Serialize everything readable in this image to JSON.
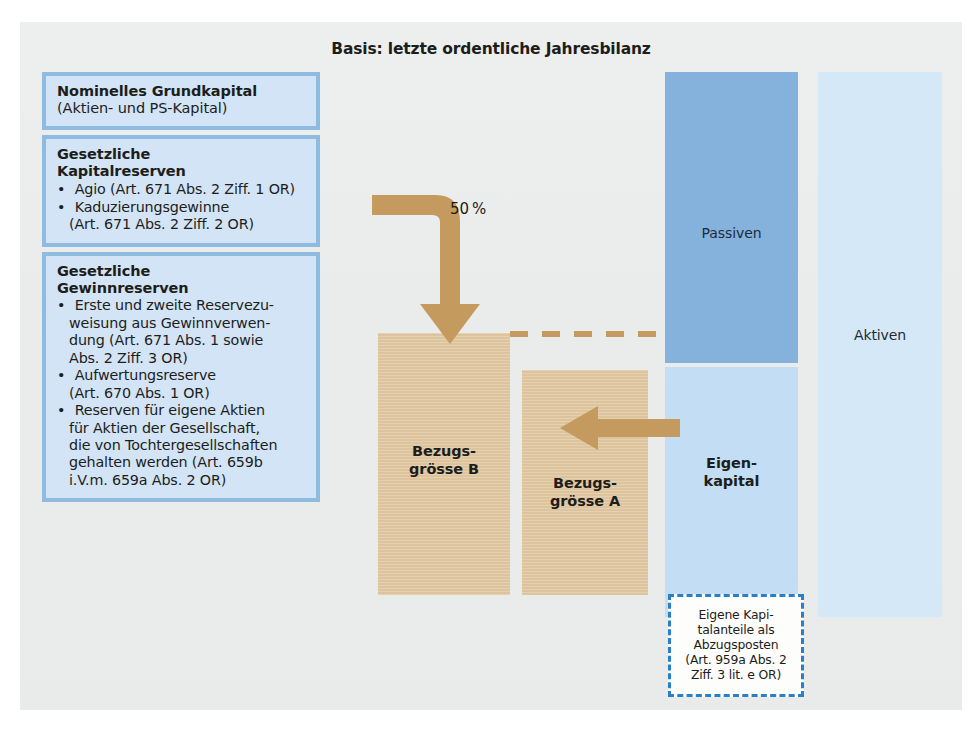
{
  "title": "Basis: letzte ordentliche Jahresbilanz",
  "colors": {
    "board_bg": "#eceeed",
    "box_frame": "#8fbbe0",
    "box_fill": "#d2e4f5",
    "passiven": "#85b2dd",
    "eigenkapital": "#c3ddf4",
    "aktiven": "#d5e8f8",
    "bar_tan": "#ddc49d",
    "arrow_tan": "#c49a5e",
    "dashed_blue": "#2a7fc9"
  },
  "left_boxes": [
    {
      "heading": "Nominelles Grundkapital",
      "subtitle": "(Aktien- und PS-Kapital)",
      "items": []
    },
    {
      "heading": "Gesetzliche\nKapitalreserven",
      "subtitle": "",
      "items": [
        {
          "main": "Agio (Art. 671 Abs. 2 Ziff. 1 OR)",
          "cont": ""
        },
        {
          "main": "Kaduzierungsgewinne",
          "cont": "(Art. 671 Abs. 2 Ziff. 2 OR)"
        }
      ]
    },
    {
      "heading": "Gesetzliche\nGewinnreserven",
      "subtitle": "",
      "items": [
        {
          "main": "Erste und zweite Reservezu-",
          "cont": "weisung aus Gewinnverwen-\ndung (Art. 671 Abs. 1 sowie\nAbs. 2 Ziff. 3 OR)"
        },
        {
          "main": "Aufwertungsreserve",
          "cont": "(Art. 670 Abs. 1 OR)"
        },
        {
          "main": "Reserven für eigene Aktien",
          "cont": "für Aktien der Gesellschaft,\ndie von Tochtergesellschaften\ngehalten werden (Art. 659b\ni.V.m. 659a Abs. 2 OR)"
        }
      ]
    }
  ],
  "flow": {
    "percent_label": "50 %",
    "elbow_arrow_icon": "elbow-down-arrow-icon",
    "horizontal_arrow_icon": "left-arrow-icon",
    "dashed_connector_icon": "dashed-line-icon"
  },
  "bars": [
    {
      "id": "bar-b",
      "label": "Bezugs-\ngrösse B"
    },
    {
      "id": "bar-a",
      "label": "Bezugs-\ngrösse A"
    }
  ],
  "balance_columns": {
    "passiven": "Passiven",
    "eigenkapital": "Eigen-\nkapital",
    "aktiven": "Aktiven"
  },
  "deduction_note": "Eigene Kapi-\ntalanteile als\nAbzugsposten\n(Art. 959a Abs. 2\nZiff. 3 lit. e OR)"
}
